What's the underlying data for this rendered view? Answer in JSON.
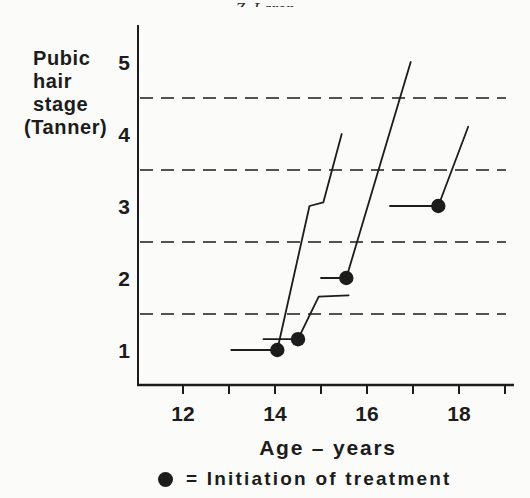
{
  "header": {
    "cropped_text": "Z. Laron"
  },
  "chart_data": {
    "type": "line",
    "title": "",
    "ylabel_lines": [
      "Pubic",
      "hair",
      "stage",
      "(Tanner)"
    ],
    "xlabel": "Age – years",
    "x_ticks": [
      12,
      13,
      14,
      15,
      16,
      17,
      18,
      19
    ],
    "x_labeled_ticks": [
      12,
      14,
      16,
      18
    ],
    "y_ticks": [
      5,
      4,
      3,
      2,
      1
    ],
    "xlim": [
      11.05,
      19.25
    ],
    "ylim": [
      0.5,
      5.55
    ],
    "dashed_gridlines_at_stage": [
      4.5,
      3.5,
      2.5,
      1.5
    ],
    "grid": "horizontal dashed lines at half-stages",
    "legend": {
      "marker": "filled-circle",
      "label": "= Initiation of treatment",
      "position": "bottom center, below axis label"
    },
    "series": [
      {
        "name": "patient-1",
        "treatment_start": {
          "age": 14.05,
          "stage": 1
        },
        "points": [
          [
            13.05,
            1
          ],
          [
            14.05,
            1
          ],
          [
            14.75,
            3
          ],
          [
            15.05,
            3.05
          ],
          [
            15.45,
            4
          ]
        ]
      },
      {
        "name": "patient-2",
        "treatment_start": {
          "age": 14.5,
          "stage": 1.15
        },
        "points": [
          [
            13.75,
            1.15
          ],
          [
            14.5,
            1.15
          ],
          [
            14.95,
            1.74
          ],
          [
            15.6,
            1.76
          ]
        ]
      },
      {
        "name": "patient-3",
        "treatment_start": {
          "age": 15.55,
          "stage": 2
        },
        "points": [
          [
            15.0,
            2
          ],
          [
            15.55,
            2
          ],
          [
            16.95,
            5
          ]
        ]
      },
      {
        "name": "patient-4",
        "treatment_start": {
          "age": 17.55,
          "stage": 3
        },
        "points": [
          [
            16.5,
            3
          ],
          [
            17.55,
            3
          ],
          [
            18.2,
            4.1
          ]
        ]
      }
    ],
    "colors": {
      "ink": "#1c1c1c",
      "background": "#fbfbf9"
    }
  }
}
